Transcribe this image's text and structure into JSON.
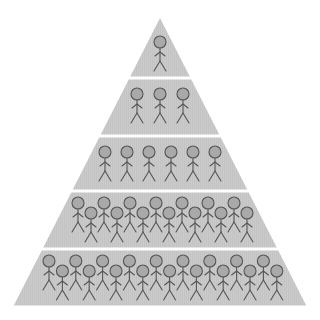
{
  "diagram": {
    "type": "population-pyramid",
    "colors": {
      "background": "#ffffff",
      "tier_fill": "#c9c9c9",
      "separator": "#ffffff",
      "figure_stroke": "#555555",
      "head_fill": "#a9a9a9"
    },
    "geometry": {
      "apex": [
        160,
        18
      ],
      "base_left": [
        13,
        307
      ],
      "base_right": [
        307,
        307
      ],
      "separators_y": [
        78,
        136,
        191,
        249
      ]
    },
    "tiers": [
      {
        "level": 1,
        "figure_count": 1,
        "rows": 1
      },
      {
        "level": 2,
        "figure_count": 3,
        "rows": 1
      },
      {
        "level": 3,
        "figure_count": 6,
        "rows": 1
      },
      {
        "level": 4,
        "figure_count": 14,
        "rows": 2
      },
      {
        "level": 5,
        "figure_count": 18,
        "rows": 2
      }
    ],
    "icon": "stick-figure-icon"
  }
}
